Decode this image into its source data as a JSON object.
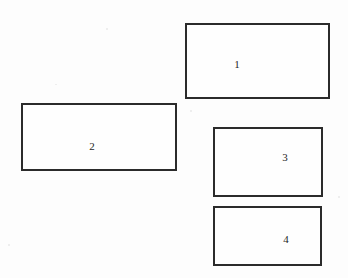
{
  "canvas": {
    "width": 348,
    "height": 278,
    "background_color": "#fdfdfd",
    "stroke_color": "#2b2b2b",
    "label_color": "#1f1f1f"
  },
  "diagram": {
    "type": "rectangle-layout",
    "shape_count": 4,
    "shapes": [
      {
        "label": "1",
        "x": 185,
        "y": 23,
        "width": 145,
        "height": 76,
        "border_width": 2,
        "label_x": 237,
        "label_y": 64
      },
      {
        "label": "2",
        "x": 21,
        "y": 103,
        "width": 156,
        "height": 68,
        "border_width": 2,
        "label_x": 92,
        "label_y": 146
      },
      {
        "label": "3",
        "x": 213,
        "y": 127,
        "width": 110,
        "height": 70,
        "border_width": 2,
        "label_x": 285,
        "label_y": 157
      },
      {
        "label": "4",
        "x": 213,
        "y": 206,
        "width": 109,
        "height": 60,
        "border_width": 2,
        "label_x": 286,
        "label_y": 239
      }
    ]
  }
}
